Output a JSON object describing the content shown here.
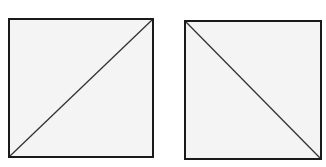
{
  "diagram": {
    "figures": [
      {
        "name": "square-left",
        "box": {
          "x": 8,
          "y": 18,
          "w": 146,
          "h": 140
        },
        "diagonal": "bottom-left-to-top-right",
        "fill": "#f4f4f4",
        "stroke": "#1a1a1a"
      },
      {
        "name": "square-right",
        "box": {
          "x": 184,
          "y": 20,
          "w": 138,
          "h": 140
        },
        "diagonal": "top-left-to-bottom-right",
        "fill": "#f4f4f4",
        "stroke": "#1a1a1a"
      }
    ]
  }
}
